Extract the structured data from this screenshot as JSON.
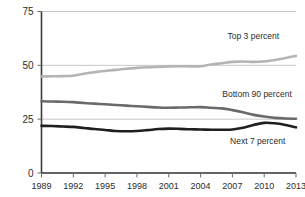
{
  "chart_data": {
    "type": "line",
    "title": "",
    "subtitle": "",
    "xlabel": "",
    "ylabel": "",
    "ylim": [
      0,
      75
    ],
    "yticks": [
      0,
      25,
      50,
      75
    ],
    "grid": true,
    "legend_position": "inline-right",
    "x": [
      1989,
      1990,
      1991,
      1992,
      1993,
      1994,
      1995,
      1996,
      1997,
      1998,
      1999,
      2000,
      2001,
      2002,
      2003,
      2004,
      2005,
      2006,
      2007,
      2008,
      2009,
      2010,
      2011,
      2012,
      2013
    ],
    "xticks": [
      1989,
      1992,
      1995,
      1998,
      2001,
      2004,
      2007,
      2010,
      2013
    ],
    "xtick_labels": [
      "1989",
      "1992",
      "1995",
      "1998",
      "2001",
      "2004",
      "2007",
      "2010",
      "2013"
    ],
    "ytick_labels": [
      "0",
      "25",
      "50",
      "75"
    ],
    "series": [
      {
        "name": "Top 3 percent",
        "color": "#b4b4b4",
        "width": 2.6,
        "label_x": 2011.4,
        "label_y": 62.0,
        "values": [
          44.8,
          44.9,
          45.0,
          45.2,
          46.1,
          46.8,
          47.4,
          47.9,
          48.4,
          48.8,
          49.1,
          49.3,
          49.5,
          49.6,
          49.5,
          49.6,
          50.4,
          51.0,
          51.6,
          51.8,
          51.6,
          51.8,
          52.5,
          53.4,
          54.4
        ]
      },
      {
        "name": "Bottom 90 percent",
        "color": "#6a6a6a",
        "width": 2.6,
        "label_x": 2012.6,
        "label_y": 35.5,
        "values": [
          33.3,
          33.2,
          33.1,
          32.9,
          32.5,
          32.2,
          31.9,
          31.6,
          31.3,
          31.0,
          30.7,
          30.4,
          30.3,
          30.4,
          30.5,
          30.6,
          30.3,
          30.0,
          29.2,
          28.2,
          27.0,
          26.2,
          25.6,
          25.3,
          25.2
        ]
      },
      {
        "name": "Next 7 percent",
        "color": "#1f1f1f",
        "width": 2.6,
        "label_x": 2012.0,
        "label_y": 13.5,
        "values": [
          21.9,
          21.8,
          21.6,
          21.4,
          20.9,
          20.4,
          20.0,
          19.5,
          19.4,
          19.5,
          19.9,
          20.4,
          20.6,
          20.5,
          20.3,
          20.2,
          20.1,
          20.1,
          20.2,
          21.0,
          22.3,
          23.3,
          23.1,
          22.3,
          21.2
        ]
      }
    ]
  },
  "axes": {
    "y_axis_name": "value-axis",
    "x_axis_name": "year-axis"
  }
}
